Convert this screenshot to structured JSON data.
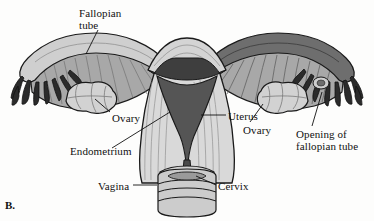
{
  "figure": {
    "panel_letter": "B.",
    "background_color": "#fdfdfc",
    "ink_color": "#111111"
  },
  "labels": {
    "fallopian_tube": "Fallopian\ntube",
    "fallopian_tube_line1": "Fallopian",
    "fallopian_tube_line2": "tube",
    "ovary_left": "Ovary",
    "endometrium": "Endometrium",
    "vagina": "Vagina",
    "uterus": "Uterus",
    "ovary_right": "Ovary",
    "opening_line1": "Opening of",
    "opening_line2": "fallopian tube",
    "cervix": "Cervix"
  },
  "palette": {
    "outline": "#1a1a1a",
    "myometrium": "#d9d9d9",
    "endometrial_cavity": "#555555",
    "fimbriae_dark": "#2b2b2b",
    "tube_light": "#cfcfcf",
    "mesosalpinx": "#a8a8a8",
    "ovary_fill": "#d2d2d2",
    "vagina_fill": "#cccccc",
    "serosa_dark": "#4a4a4a"
  },
  "structures": [
    {
      "name": "fundus-of-uterus",
      "tone": "light-striated"
    },
    {
      "name": "uterine-body-myometrium",
      "tone": "light-gray"
    },
    {
      "name": "endometrial-cavity",
      "tone": "dark-gray-triangle"
    },
    {
      "name": "cervical-canal",
      "tone": "dark-gray"
    },
    {
      "name": "vagina",
      "tone": "banded-cylinder"
    },
    {
      "name": "left-fallopian-tube",
      "tone": "pale-tube"
    },
    {
      "name": "right-fallopian-tube",
      "tone": "dark-tube"
    },
    {
      "name": "left-fimbriae",
      "tone": "dark-fingers"
    },
    {
      "name": "right-fimbriae",
      "tone": "dark-fingers"
    },
    {
      "name": "left-ovary",
      "tone": "lobed-light-gray"
    },
    {
      "name": "right-ovary",
      "tone": "lobed-light-gray"
    },
    {
      "name": "broad-ligament-mesosalpinx",
      "tone": "striated-gray"
    }
  ]
}
